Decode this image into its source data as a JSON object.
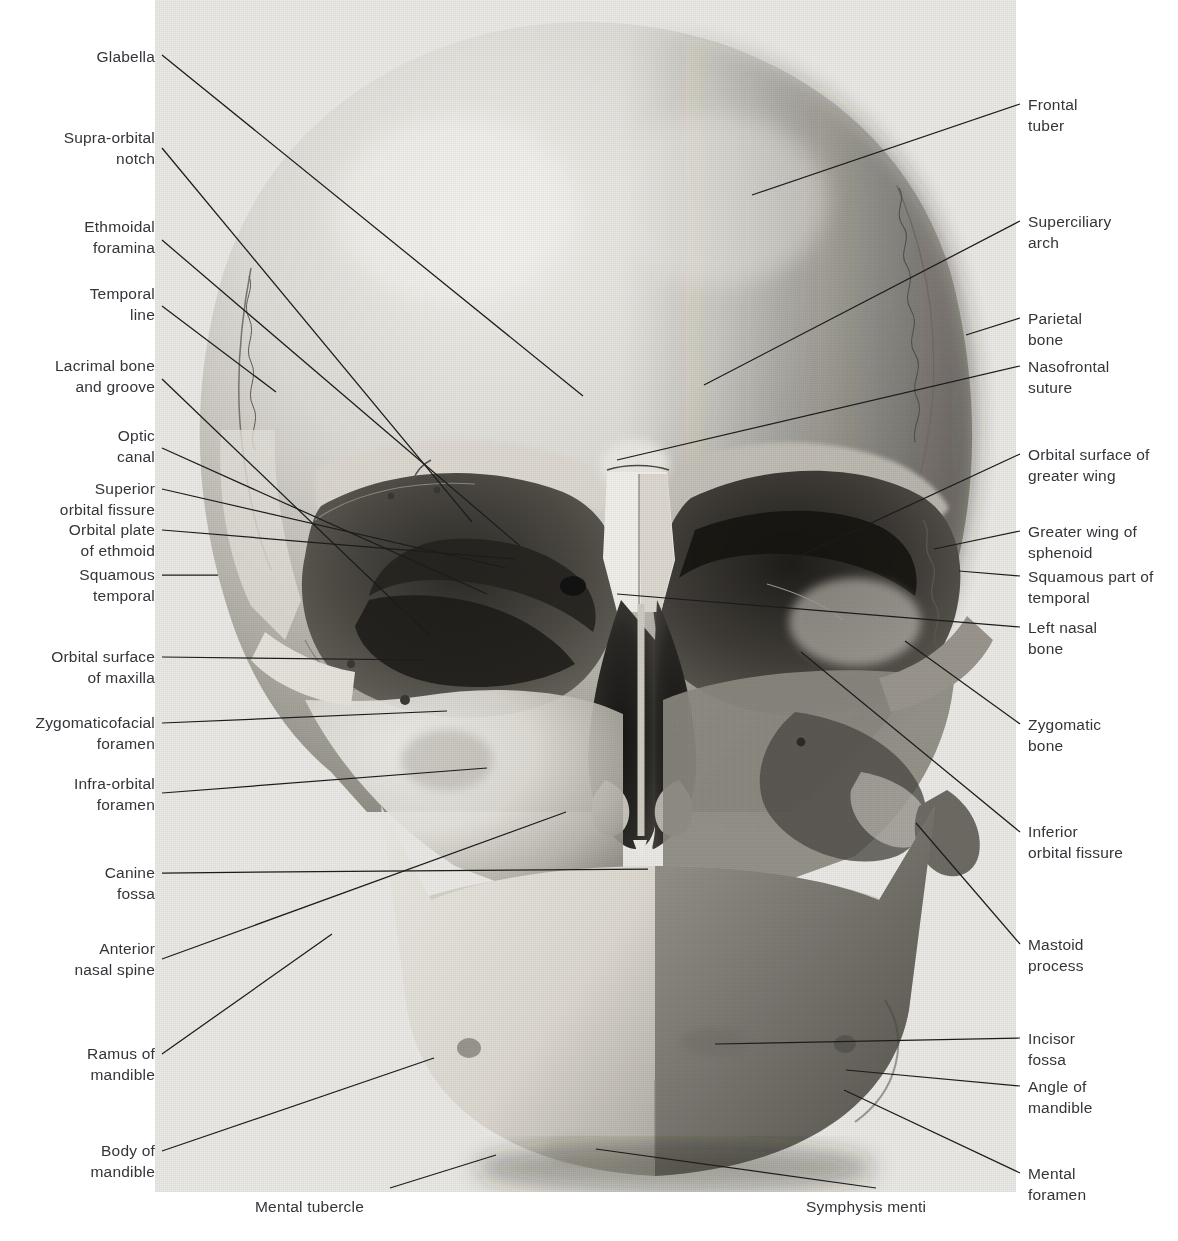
{
  "figure": {
    "plate_background": "#e9e8e4",
    "line_color": "#1c1c1c",
    "text_color": "#34343a"
  },
  "labels_left": [
    {
      "text": "Glabella",
      "x": 155,
      "y": 46,
      "lx": 162,
      "ly": 55,
      "tx": 583,
      "ty": 396
    },
    {
      "text": "Supra-orbital\nnotch",
      "x": 155,
      "y": 127,
      "lx": 162,
      "ly": 148,
      "tx": 472,
      "ty": 522
    },
    {
      "text": "Ethmoidal\nforamina",
      "x": 155,
      "y": 216,
      "lx": 162,
      "ly": 240,
      "tx": 520,
      "ty": 546
    },
    {
      "text": "Temporal\nline",
      "x": 155,
      "y": 283,
      "lx": 162,
      "ly": 306,
      "tx": 276,
      "ty": 392
    },
    {
      "text": "Lacrimal bone\nand groove",
      "x": 155,
      "y": 355,
      "lx": 162,
      "ly": 379,
      "tx": 430,
      "ty": 636
    },
    {
      "text": "Optic\ncanal",
      "x": 155,
      "y": 425,
      "lx": 162,
      "ly": 448,
      "tx": 487,
      "ty": 594
    },
    {
      "text": "Superior\norbital fissure",
      "x": 155,
      "y": 478,
      "lx": 162,
      "ly": 489,
      "tx": 506,
      "ty": 568
    },
    {
      "text": "Orbital plate\nof ethmoid",
      "x": 155,
      "y": 519,
      "lx": 162,
      "ly": 530,
      "tx": 515,
      "ty": 559
    },
    {
      "text": "Squamous\ntemporal",
      "x": 155,
      "y": 564,
      "lx": 162,
      "ly": 575,
      "tx": 218,
      "ty": 575
    },
    {
      "text": "Orbital surface\nof maxilla",
      "x": 155,
      "y": 646,
      "lx": 162,
      "ly": 657,
      "tx": 425,
      "ty": 660
    },
    {
      "text": "Zygomaticofacial\nforamen",
      "x": 155,
      "y": 712,
      "lx": 162,
      "ly": 723,
      "tx": 447,
      "ty": 711
    },
    {
      "text": "Infra-orbital\nforamen",
      "x": 155,
      "y": 773,
      "lx": 162,
      "ly": 793,
      "tx": 487,
      "ty": 768
    },
    {
      "text": "Canine\nfossa",
      "x": 155,
      "y": 862,
      "lx": 162,
      "ly": 873,
      "tx": 648,
      "ty": 869
    },
    {
      "text": "Anterior\nnasal spine",
      "x": 155,
      "y": 938,
      "lx": 162,
      "ly": 959,
      "tx": 566,
      "ty": 812
    },
    {
      "text": "Ramus of\nmandible",
      "x": 155,
      "y": 1043,
      "lx": 162,
      "ly": 1054,
      "tx": 332,
      "ty": 934
    },
    {
      "text": "Body of\nmandible",
      "x": 155,
      "y": 1140,
      "lx": 162,
      "ly": 1151,
      "tx": 434,
      "ty": 1058
    }
  ],
  "labels_right": [
    {
      "text": "Frontal\ntuber",
      "x": 1028,
      "y": 94,
      "lx": 1020,
      "ly": 104,
      "tx": 752,
      "ty": 195
    },
    {
      "text": "Superciliary\narch",
      "x": 1028,
      "y": 211,
      "lx": 1020,
      "ly": 221,
      "tx": 704,
      "ty": 385
    },
    {
      "text": "Parietal\nbone",
      "x": 1028,
      "y": 308,
      "lx": 1020,
      "ly": 318,
      "tx": 966,
      "ty": 335
    },
    {
      "text": "Nasofrontal\nsuture",
      "x": 1028,
      "y": 356,
      "lx": 1020,
      "ly": 366,
      "tx": 617,
      "ty": 460
    },
    {
      "text": "Orbital surface of\ngreater wing",
      "x": 1028,
      "y": 444,
      "lx": 1020,
      "ly": 454,
      "tx": 800,
      "ty": 556
    },
    {
      "text": "Greater wing of\nsphenoid",
      "x": 1028,
      "y": 521,
      "lx": 1020,
      "ly": 531,
      "tx": 934,
      "ty": 549
    },
    {
      "text": "Squamous part of\ntemporal",
      "x": 1028,
      "y": 566,
      "lx": 1020,
      "ly": 576,
      "tx": 959,
      "ty": 571
    },
    {
      "text": "Left nasal\nbone",
      "x": 1028,
      "y": 617,
      "lx": 1020,
      "ly": 627,
      "tx": 617,
      "ty": 594
    },
    {
      "text": "Zygomatic\nbone",
      "x": 1028,
      "y": 714,
      "lx": 1020,
      "ly": 724,
      "tx": 905,
      "ty": 641
    },
    {
      "text": "Inferior\norbital fissure",
      "x": 1028,
      "y": 821,
      "lx": 1020,
      "ly": 832,
      "tx": 801,
      "ty": 652
    },
    {
      "text": "Mastoid\nprocess",
      "x": 1028,
      "y": 934,
      "lx": 1020,
      "ly": 944,
      "tx": 916,
      "ty": 823
    },
    {
      "text": "Incisor\nfossa",
      "x": 1028,
      "y": 1028,
      "lx": 1020,
      "ly": 1038,
      "tx": 715,
      "ty": 1044
    },
    {
      "text": "Angle of\nmandible",
      "x": 1028,
      "y": 1076,
      "lx": 1020,
      "ly": 1086,
      "tx": 846,
      "ty": 1070
    },
    {
      "text": "Mental\nforamen",
      "x": 1028,
      "y": 1163,
      "lx": 1020,
      "ly": 1173,
      "tx": 844,
      "ty": 1090
    }
  ],
  "labels_bottom": [
    {
      "text": "Mental tubercle",
      "x": 255,
      "y": 1196,
      "lx": 390,
      "ly": 1188,
      "tx": 496,
      "ty": 1155
    },
    {
      "text": "Symphysis menti",
      "x": 806,
      "y": 1196,
      "lx": 876,
      "ly": 1188,
      "tx": 596,
      "ty": 1149
    }
  ],
  "caption": ""
}
